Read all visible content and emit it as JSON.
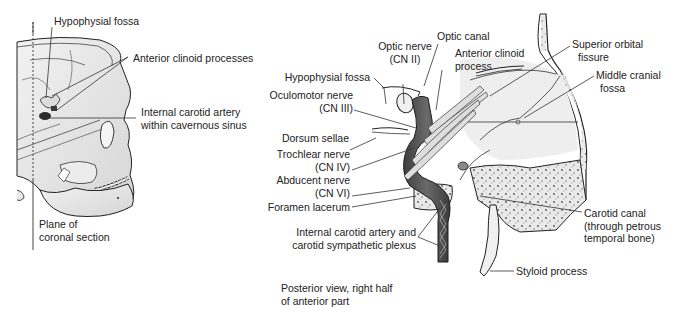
{
  "figure": {
    "left_panel": {
      "description": "Lateral view of skull showing plane of coronal section",
      "labels": {
        "hypophysial_fossa": "Hypophysial fossa",
        "anterior_clinoid_processes": "Anterior clinoid processes",
        "internal_carotid_line1": "Internal carotid artery",
        "internal_carotid_line2": "within cavernous sinus",
        "plane_line1": "Plane of",
        "plane_line2": "coronal section"
      }
    },
    "right_panel": {
      "caption_line1": "Posterior view, right half",
      "caption_line2": "of anterior part",
      "labels": {
        "optic_nerve_line1": "Optic nerve",
        "optic_nerve_line2": "(CN II)",
        "optic_canal": "Optic canal",
        "anterior_clinoid_line1": "Anterior clinoid",
        "anterior_clinoid_line2": "process",
        "hypophysial_fossa": "Hypophysial fossa",
        "oculomotor_line1": "Oculomotor nerve",
        "oculomotor_line2": "(CN III)",
        "dorsum_sellae": "Dorsum sellae",
        "trochlear_line1": "Trochlear nerve",
        "trochlear_line2": "(CN IV)",
        "abducent_line1": "Abducent nerve",
        "abducent_line2": "(CN VI)",
        "foramen_lacerum": "Foramen lacerum",
        "ica_plexus_line1": "Internal carotid artery and",
        "ica_plexus_line2": "carotid sympathetic plexus",
        "superior_orbital_line1": "Superior orbital",
        "superior_orbital_line2": "fissure",
        "middle_cranial_line1": "Middle cranial",
        "middle_cranial_line2": "fossa",
        "carotid_canal_line1": "Carotid canal",
        "carotid_canal_line2": "(through petrous",
        "carotid_canal_line3": "temporal bone)",
        "styloid_process": "Styloid process"
      }
    },
    "colors": {
      "bone": "#e6e6e6",
      "bone_dark": "#c8c8c8",
      "artery": "#5a5a5a",
      "outline": "#222222",
      "leader": "#333333"
    }
  }
}
